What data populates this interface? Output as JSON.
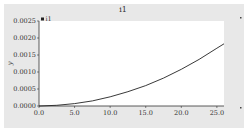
{
  "chart_data": {
    "type": "line",
    "title": "i1",
    "xlabel": "",
    "ylabel": "y",
    "xlim": [
      0,
      26
    ],
    "ylim": [
      0,
      0.0025
    ],
    "x_ticks": [
      "0.0",
      "5.0",
      "10.0",
      "15.0",
      "20.0",
      "25.0"
    ],
    "y_ticks": [
      "0.0000",
      "0.0005",
      "0.0010",
      "0.0015",
      "0.0020",
      "0.0025"
    ],
    "grid": false,
    "legend": {
      "position": "top-left",
      "entries": [
        "i1"
      ]
    },
    "series": [
      {
        "name": "i1",
        "x": [
          0,
          2.5,
          5,
          7.5,
          10,
          12.5,
          15,
          17.5,
          20,
          22.5,
          25,
          26
        ],
        "y": [
          0.0,
          2e-05,
          7e-05,
          0.00015,
          0.00027,
          0.00042,
          0.0006,
          0.00082,
          0.00108,
          0.00137,
          0.0017,
          0.00183
        ]
      }
    ]
  },
  "colors": {
    "background": "#e8e8e8",
    "plot_area": "#ffffff",
    "line": "#222222"
  }
}
